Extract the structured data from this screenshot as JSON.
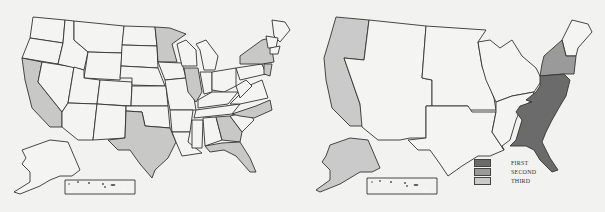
{
  "colors": {
    "background": "#f2f2f0",
    "outline": "#333333",
    "unfilled": "#f4f4f2",
    "highlight_light": "#c8c8c6",
    "first": "#6b6b6b",
    "second": "#9a9a9a",
    "third": "#cacaca"
  },
  "left_map": {
    "highlighted_states": [
      "Washington? no",
      "California",
      "Texas",
      "Minnesota",
      "Illinois",
      "New York",
      "North Carolina",
      "Georgia",
      "Florida",
      "New Jersey"
    ]
  },
  "right_map": {
    "regions": [
      {
        "name": "Pacific",
        "rank": "third"
      },
      {
        "name": "Alaska",
        "rank": "third"
      },
      {
        "name": "Middle Atlantic",
        "rank": "second"
      },
      {
        "name": "South Atlantic",
        "rank": "first"
      }
    ]
  },
  "legend": {
    "items": [
      {
        "label": "FIRST",
        "color": "#6b6b6b"
      },
      {
        "label": "SECOND",
        "color": "#9a9a9a"
      },
      {
        "label": "THIRD",
        "color": "#cacaca"
      }
    ]
  }
}
